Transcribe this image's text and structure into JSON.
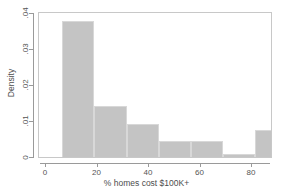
{
  "chart_data": {
    "type": "bar",
    "chart_subtype": "histogram",
    "title": "",
    "xlabel": "% homes cost $100K+",
    "ylabel": "Density",
    "xlim": [
      0,
      91
    ],
    "ylim": [
      0,
      0.04
    ],
    "grid": false,
    "legend": null,
    "xticks": [
      0,
      20,
      40,
      60,
      80
    ],
    "xtick_labels": [
      "0",
      "20",
      "40",
      "60",
      "80"
    ],
    "yticks": [
      0,
      0.01,
      0.02,
      0.03,
      0.04
    ],
    "ytick_labels": [
      "0",
      ".01",
      ".02",
      ".03",
      ".04"
    ],
    "bin_edges": [
      6.3,
      18.8,
      31.3,
      43.8,
      56.3,
      68.8,
      81.3,
      90.8
    ],
    "bins": [
      {
        "x0": 6.3,
        "x1": 18.8,
        "density": 0.038
      },
      {
        "x0": 18.8,
        "x1": 31.3,
        "density": 0.0144
      },
      {
        "x0": 31.3,
        "x1": 43.8,
        "density": 0.0094
      },
      {
        "x0": 43.8,
        "x1": 56.3,
        "density": 0.0047
      },
      {
        "x0": 56.3,
        "x1": 68.8,
        "density": 0.0047
      },
      {
        "x0": 68.8,
        "x1": 81.3,
        "density": 0.0012
      },
      {
        "x0": 81.3,
        "x1": 90.8,
        "density": 0.0078
      }
    ],
    "values": [
      0.038,
      0.0144,
      0.0094,
      0.0047,
      0.0047,
      0.0012,
      0.0078
    ],
    "categories": [
      "6.3-18.8",
      "18.8-31.3",
      "31.3-43.8",
      "43.8-56.3",
      "56.3-68.8",
      "68.8-81.3",
      "81.3-90.8"
    ],
    "colors": {
      "bar_fill": "#c4c4c4",
      "bar_edge": "#d8d8d8",
      "axis": "#9a9a9a",
      "panel_border": "#c8c8c8",
      "text": "#4d4d4d",
      "background": "#ffffff"
    }
  }
}
